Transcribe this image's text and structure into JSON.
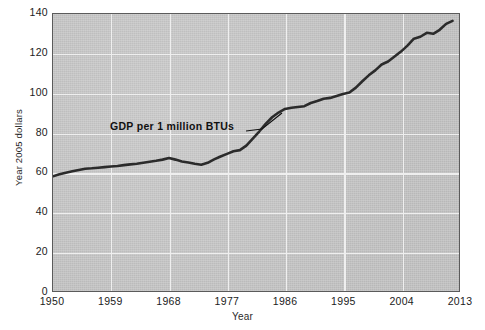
{
  "chart_data": {
    "type": "line",
    "title": "",
    "xlabel": "Year",
    "ylabel": "Year 2005 dollars",
    "xlim": [
      1950,
      2013
    ],
    "ylim": [
      0,
      140
    ],
    "grid": true,
    "legend_position": "none",
    "annotations": [
      {
        "text": "GDP per 1 million BTUs",
        "points_to_x": 1982,
        "points_to_y": 82
      }
    ],
    "x_tick_labels": [
      "1950",
      "1959",
      "1968",
      "1977",
      "1986",
      "1995",
      "2004",
      "2013"
    ],
    "x_tick_values": [
      1950,
      1959,
      1968,
      1977,
      1986,
      1995,
      2004,
      2013
    ],
    "y_tick_labels": [
      "0",
      "20",
      "40",
      "60",
      "80",
      "100",
      "120",
      "140"
    ],
    "y_tick_values": [
      0,
      20,
      40,
      60,
      80,
      100,
      120,
      140
    ],
    "series": [
      {
        "name": "GDP per 1 million BTUs",
        "color": "#2b2b2b",
        "x": [
          1950,
          1951,
          1952,
          1953,
          1954,
          1955,
          1956,
          1957,
          1958,
          1959,
          1960,
          1961,
          1962,
          1963,
          1964,
          1965,
          1966,
          1967,
          1968,
          1969,
          1970,
          1971,
          1972,
          1973,
          1974,
          1975,
          1976,
          1977,
          1978,
          1979,
          1980,
          1981,
          1982,
          1983,
          1984,
          1985,
          1986,
          1987,
          1988,
          1989,
          1990,
          1991,
          1992,
          1993,
          1994,
          1995,
          1996,
          1997,
          1998,
          1999,
          2000,
          2001,
          2002,
          2003,
          2004,
          2005,
          2006,
          2007,
          2008,
          2009,
          2010,
          2011,
          2012
        ],
        "y": [
          58.0,
          59.0,
          59.8,
          60.5,
          61.2,
          61.8,
          62.0,
          62.3,
          62.6,
          62.9,
          63.2,
          63.6,
          64.0,
          64.3,
          64.8,
          65.3,
          65.8,
          66.4,
          67.2,
          66.4,
          65.5,
          64.9,
          64.3,
          63.8,
          64.8,
          66.5,
          68.0,
          69.3,
          70.6,
          71.2,
          73.5,
          77.0,
          80.6,
          84.5,
          87.8,
          90.2,
          92.0,
          92.6,
          93.0,
          93.4,
          95.0,
          96.0,
          97.2,
          97.6,
          98.6,
          99.6,
          100.3,
          102.8,
          106.0,
          109.0,
          111.5,
          114.5,
          116.0,
          118.5,
          121.0,
          124.0,
          127.5,
          128.5,
          130.5,
          130.0,
          132.0,
          135.0,
          136.5
        ]
      }
    ]
  },
  "axes": {
    "y_title": "Year 2005 dollars",
    "x_title": "Year"
  },
  "caption": {
    "source_note": ""
  },
  "colors": {
    "plot_background": "#c9c9c9",
    "gridline": "#efefef",
    "frame": "#5b5b5b",
    "line": "#2b2b2b",
    "text": "#1b1b1b"
  }
}
